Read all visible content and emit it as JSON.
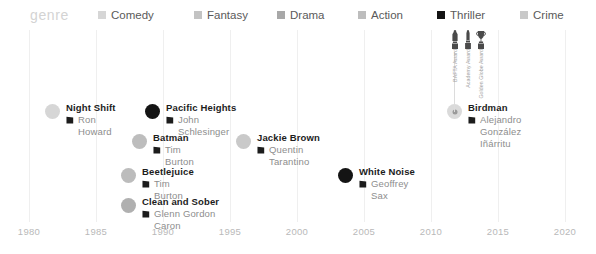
{
  "legend": {
    "title": "genre",
    "items": [
      {
        "label": "Comedy",
        "color": "#d6d6d6",
        "x": 98
      },
      {
        "label": "Fantasy",
        "color": "#c3c3c3",
        "x": 194
      },
      {
        "label": "Drama",
        "color": "#a8a8a8",
        "x": 277
      },
      {
        "label": "Action",
        "color": "#bdbdbd",
        "x": 358
      },
      {
        "label": "Thriller",
        "color": "#141414",
        "x": 437
      },
      {
        "label": "Crime",
        "color": "#c9c9c9",
        "x": 520
      }
    ]
  },
  "axis": {
    "ticks": [
      {
        "label": "1980",
        "x": 29
      },
      {
        "label": "1985",
        "x": 96
      },
      {
        "label": "1990",
        "x": 163
      },
      {
        "label": "1995",
        "x": 230
      },
      {
        "label": "2000",
        "x": 297
      },
      {
        "label": "2005",
        "x": 364
      },
      {
        "label": "2010",
        "x": 431
      },
      {
        "label": "2015",
        "x": 498
      },
      {
        "label": "2020",
        "x": 565
      }
    ],
    "gridlines": [
      29,
      96,
      163,
      230,
      297,
      364,
      431,
      498,
      565
    ],
    "range": [
      1980,
      2020
    ],
    "step": 5
  },
  "films": [
    {
      "title": "Night Shift",
      "director": "Ron Howard",
      "year": 1982,
      "genre": "Comedy",
      "color": "#d6d6d6",
      "ring": false,
      "x": 45,
      "y": 74
    },
    {
      "title": "Pacific Heights",
      "director": "John Schlesinger",
      "year": 1990,
      "genre": "Thriller",
      "color": "#141414",
      "ring": false,
      "x": 145,
      "y": 74
    },
    {
      "title": "Batman",
      "director": "Tim Burton",
      "year": 1989,
      "genre": "Action",
      "color": "#bdbdbd",
      "ring": false,
      "x": 132,
      "y": 104
    },
    {
      "title": "Jackie Brown",
      "director": "Quentin Tarantino",
      "year": 1997,
      "genre": "Crime",
      "color": "#c9c9c9",
      "ring": false,
      "x": 236,
      "y": 104
    },
    {
      "title": "Beetlejuice",
      "director": "Tim Burton",
      "year": 1988,
      "genre": "Fantasy",
      "color": "#bcbcbc",
      "ring": false,
      "x": 121,
      "y": 138
    },
    {
      "title": "White Noise",
      "director": "Geoffrey Sax",
      "year": 2005,
      "genre": "Thriller",
      "color": "#141414",
      "ring": false,
      "x": 338,
      "y": 138
    },
    {
      "title": "Clean and Sober",
      "director": "Glenn Gordon Caron",
      "year": 1988,
      "genre": "Drama",
      "color": "#b0b0b0",
      "ring": false,
      "x": 121,
      "y": 168
    },
    {
      "title": "Birdman",
      "director": "Alejandro González Iñárritu",
      "year": 2014,
      "genre": "Drama",
      "color": "#dadada",
      "ring": true,
      "x": 447,
      "y": 74
    }
  ],
  "awards": {
    "stem_x": 454,
    "items": [
      {
        "name": "BAFTA Award",
        "label": "BAFTA Award",
        "icon": "bafta-statuette",
        "x": 455
      },
      {
        "name": "Academy Award",
        "label": "Academy Award",
        "icon": "oscar-statuette",
        "x": 468
      },
      {
        "name": "Golden Globe Award",
        "label": "Golden Globe Award",
        "icon": "globe-statuette",
        "x": 481
      }
    ]
  },
  "colors": {
    "gridline": "#efefef",
    "axis_text": "#b9b9b9",
    "title_text": "#1c1c1c",
    "director_text": "#8d8d8d",
    "legend_title": "#d3d3d3",
    "legend_text": "#5a5a5a"
  }
}
